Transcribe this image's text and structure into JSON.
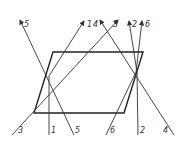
{
  "diagram": {
    "type": "ray-refraction-through-parallelogram-prism",
    "prism": {
      "points": [
        [
          53,
          52
        ],
        [
          143,
          52
        ],
        [
          124,
          113
        ],
        [
          34,
          113
        ]
      ]
    },
    "rays": [
      {
        "id": "1",
        "label": "1",
        "path": [
          [
            49,
            135
          ],
          [
            49,
            76
          ],
          [
            84,
            21
          ]
        ],
        "top_label": [
          88,
          25
        ],
        "bottom_label": [
          51,
          131
        ]
      },
      {
        "id": "2",
        "label": "2",
        "path": [
          [
            138,
            135
          ],
          [
            137,
            72
          ],
          [
            129,
            21
          ]
        ],
        "top_label": [
          133,
          25
        ],
        "bottom_label": [
          140,
          131
        ]
      },
      {
        "id": "3",
        "label": "3",
        "path": [
          [
            12,
            135
          ],
          [
            118,
            20
          ]
        ],
        "top_label": [
          112,
          25
        ],
        "bottom_label": [
          17,
          131
        ]
      },
      {
        "id": "4",
        "label": "4",
        "path": [
          [
            174,
            135
          ],
          [
            100,
            20
          ]
        ],
        "top_label": [
          94,
          25
        ],
        "bottom_label": [
          163,
          131
        ]
      },
      {
        "id": "5",
        "label": "5",
        "path": [
          [
            74,
            135
          ],
          [
            20,
            20
          ]
        ],
        "top_label": [
          24,
          25
        ],
        "bottom_label": [
          76,
          131
        ]
      },
      {
        "id": "6",
        "label": "6",
        "path": [
          [
            106,
            135
          ],
          [
            136,
            72
          ],
          [
            142,
            21
          ]
        ],
        "top_label": [
          146,
          25
        ],
        "bottom_label": [
          109,
          131
        ]
      }
    ],
    "colors": {
      "line": "#333333",
      "background": "#ffffff"
    }
  },
  "labels": {
    "top": [
      "5",
      "1",
      "4",
      "3",
      "2",
      "6"
    ],
    "bottom": [
      "3",
      "1",
      "5",
      "6",
      "2",
      "4"
    ]
  }
}
